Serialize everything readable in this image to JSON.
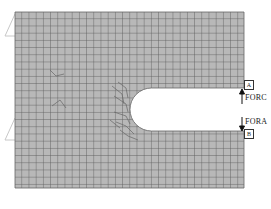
{
  "diagram": {
    "type": "finite-element-mesh",
    "colors": {
      "mesh_fill": "#b8b8b8",
      "mesh_line": "#555555",
      "background": "#ffffff",
      "support": "#cccccc"
    },
    "mesh": {
      "x": 15,
      "y": 12,
      "width": 229,
      "height": 176,
      "cell": 7.2
    },
    "slot": {
      "x_left": 130,
      "y_top": 88,
      "y_bottom": 131,
      "radius": 21.5
    },
    "points": [
      {
        "id": "A",
        "label": "A",
        "force": "FORC",
        "direction": "up"
      },
      {
        "id": "B",
        "label": "B",
        "force": "FORA",
        "direction": "down"
      }
    ]
  }
}
